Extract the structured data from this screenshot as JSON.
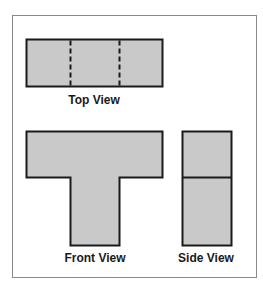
{
  "diagram": {
    "type": "orthographic-projection",
    "colors": {
      "fill": "#c9c9c9",
      "stroke": "#1a1a1a",
      "frame": "#8a8a8a",
      "background": "#ffffff"
    },
    "views": [
      {
        "name": "top",
        "label": "Top View",
        "shape": "rectangle",
        "hidden_lines": 2
      },
      {
        "name": "front",
        "label": "Front View",
        "shape": "T-shape"
      },
      {
        "name": "side",
        "label": "Side View",
        "shape": "rectangle-with-horizontal-divider"
      }
    ]
  }
}
